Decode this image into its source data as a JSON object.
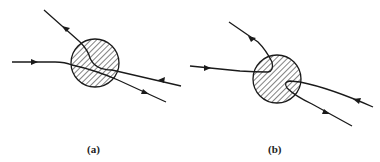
{
  "figure": {
    "panels": [
      {
        "id": "a",
        "label": "(a)",
        "description": "Trajectories crossing through a hatched disk (transmission)"
      },
      {
        "id": "b",
        "label": "(b)",
        "description": "Trajectories reflected back by a hatched disk (reflection)"
      }
    ],
    "colors": {
      "stroke": "#1a1a1a",
      "background": "#ffffff"
    }
  }
}
